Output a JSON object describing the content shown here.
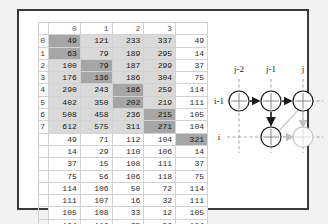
{
  "panel": {
    "title": "numeric-grid-and-lattice-panel"
  },
  "table": {
    "column_headers": [
      "0",
      "1",
      "2",
      "3"
    ],
    "row_indices": [
      "0",
      "1",
      "2",
      "3",
      "4",
      "5",
      "6",
      "7"
    ],
    "main_rows": [
      {
        "index": "0",
        "cells": [
          "49",
          "121",
          "233",
          "337"
        ],
        "shades": [
          2,
          1,
          1,
          1
        ],
        "extra": "49"
      },
      {
        "index": "1",
        "cells": [
          "63",
          "79",
          "189",
          "295"
        ],
        "shades": [
          2,
          1,
          1,
          1
        ],
        "extra": "14"
      },
      {
        "index": "2",
        "cells": [
          "100",
          "79",
          "187",
          "299"
        ],
        "shades": [
          1,
          2,
          1,
          1
        ],
        "extra": "37"
      },
      {
        "index": "3",
        "cells": [
          "176",
          "136",
          "186",
          "304"
        ],
        "shades": [
          1,
          2,
          1,
          1
        ],
        "extra": "75"
      },
      {
        "index": "4",
        "cells": [
          "290",
          "243",
          "186",
          "259"
        ],
        "shades": [
          1,
          1,
          2,
          1
        ],
        "extra": "114"
      },
      {
        "index": "5",
        "cells": [
          "402",
          "350",
          "202",
          "219"
        ],
        "shades": [
          1,
          1,
          2,
          1
        ],
        "extra": "111"
      },
      {
        "index": "6",
        "cells": [
          "508",
          "458",
          "236",
          "215"
        ],
        "shades": [
          1,
          1,
          1,
          2
        ],
        "extra": "105"
      },
      {
        "index": "7",
        "cells": [
          "612",
          "575",
          "311",
          "271"
        ],
        "shades": [
          1,
          1,
          1,
          2
        ],
        "extra": "104"
      }
    ],
    "lower_rows": [
      {
        "cells": [
          "49",
          "71",
          "112",
          "104",
          "321"
        ],
        "highlight_last": true
      },
      {
        "cells": [
          "14",
          "29",
          "110",
          "106",
          "14"
        ],
        "highlight_last": false
      },
      {
        "cells": [
          "37",
          "15",
          "108",
          "111",
          "37"
        ],
        "highlight_last": false
      },
      {
        "cells": [
          "75",
          "56",
          "106",
          "118",
          "75"
        ],
        "highlight_last": false
      },
      {
        "cells": [
          "114",
          "106",
          "50",
          "72",
          "114"
        ],
        "highlight_last": false
      },
      {
        "cells": [
          "111",
          "107",
          "16",
          "32",
          "111"
        ],
        "highlight_last": false
      },
      {
        "cells": [
          "105",
          "108",
          "33",
          "12",
          "105"
        ],
        "highlight_last": false
      },
      {
        "cells": [
          "104",
          "116",
          "75",
          "56",
          "104"
        ],
        "highlight_last": false
      }
    ]
  },
  "diagram": {
    "type": "lattice-trellis",
    "column_labels": [
      "j-2",
      "j-1",
      "j"
    ],
    "row_labels": [
      "i-1",
      "i"
    ],
    "nodes": [
      {
        "id": "n-i1-j2",
        "row": "i-1",
        "col": "j-2",
        "style": "solid"
      },
      {
        "id": "n-i1-j1",
        "row": "i-1",
        "col": "j-1",
        "style": "solid"
      },
      {
        "id": "n-i1-j",
        "row": "i-1",
        "col": "j",
        "style": "solid"
      },
      {
        "id": "n-i-j1",
        "row": "i",
        "col": "j-1",
        "style": "solid"
      },
      {
        "id": "n-i-j",
        "row": "i",
        "col": "j",
        "style": "faded"
      }
    ],
    "arrows": [
      {
        "from": "n-i1-j2",
        "to": "n-i1-j1",
        "style": "solid",
        "direction": "right"
      },
      {
        "from": "n-i1-j1",
        "to": "n-i1-j",
        "style": "solid",
        "direction": "right"
      },
      {
        "from": "n-i1-j1",
        "to": "n-i-j1",
        "style": "solid",
        "direction": "down"
      },
      {
        "from": "n-i1-j",
        "to": "n-i-j",
        "style": "faded",
        "direction": "down"
      },
      {
        "from": "n-i-j1",
        "to": "n-i-j",
        "style": "faded",
        "direction": "right"
      },
      {
        "from": "n-i1-j",
        "to": "n-i-j1",
        "style": "faded",
        "direction": "diagonal"
      }
    ],
    "colors": {
      "solid": "#1a1a1a",
      "faded": "#bfbfbf",
      "gridline": "#9a9a9a"
    }
  }
}
